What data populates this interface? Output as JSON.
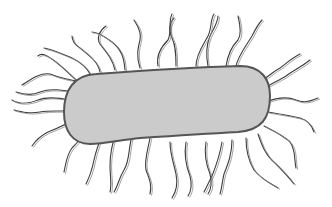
{
  "figure": {
    "cell_body": {
      "shape": "bacillus",
      "fill": "#cbcbcb",
      "outline": "#555555"
    },
    "flagella_color": "#444444",
    "flagella_count_approx": 26,
    "background": "#ffffff"
  },
  "caption": {
    "text": "",
    "state": "cropped / illegible"
  }
}
